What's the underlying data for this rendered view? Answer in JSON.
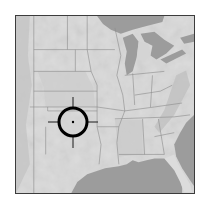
{
  "map": {
    "type": "shaded-relief",
    "region": "Central and Eastern United States",
    "style": "grayscale",
    "colors": {
      "land": "#dcdcdc",
      "land_shade": "#cfcfcf",
      "water": "#9c9c9c",
      "state_border": "#8a8a8a",
      "frame": "#3c3c3c",
      "marker": "#000000"
    },
    "marker": {
      "type": "crosshair-target",
      "label": "Target location",
      "x": 73,
      "y": 122,
      "radius": 14
    }
  }
}
